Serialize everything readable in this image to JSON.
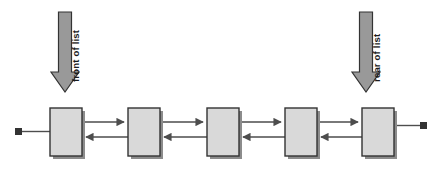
{
  "diagram": {
    "type": "doubly-linked-list",
    "background_color": "#ffffff",
    "node_count": 5,
    "node_fill": "#d9d9d9",
    "node_stroke": "#333333",
    "node_shadow": "#8c8c8c",
    "line_color": "#4d4d4d",
    "terminator_color": "#333333",
    "arrow_fill": "#999999",
    "arrow_stroke": "#333333",
    "nodes": [
      {
        "id": "node-1",
        "label": "",
        "x": 50,
        "y": 108,
        "width": 32,
        "height": 48
      },
      {
        "id": "node-2",
        "label": "",
        "x": 128,
        "y": 108,
        "width": 32,
        "height": 48
      },
      {
        "id": "node-3",
        "label": "",
        "x": 207,
        "y": 108,
        "width": 32,
        "height": 48
      },
      {
        "id": "node-4",
        "label": "",
        "x": 285,
        "y": 108,
        "width": 32,
        "height": 48
      },
      {
        "id": "node-5",
        "label": "",
        "x": 362,
        "y": 108,
        "width": 32,
        "height": 48
      }
    ],
    "links": [
      {
        "id": "link-1-2",
        "from": "node-1",
        "to": "node-2",
        "direction": "bidirectional"
      },
      {
        "id": "link-2-3",
        "from": "node-2",
        "to": "node-3",
        "direction": "bidirectional"
      },
      {
        "id": "link-3-4",
        "from": "node-3",
        "to": "node-4",
        "direction": "bidirectional"
      },
      {
        "id": "link-4-5",
        "from": "node-4",
        "to": "node-5",
        "direction": "bidirectional"
      }
    ],
    "terminators": [
      {
        "id": "terminator-left",
        "side": "left",
        "x": 18,
        "y": 131,
        "size": 7
      },
      {
        "id": "terminator-right",
        "side": "right",
        "x": 420,
        "y": 122,
        "size": 7
      }
    ],
    "pointers": [
      {
        "id": "front-pointer",
        "label": "front of list",
        "target_node": "node-1",
        "orientation": "vertical-down",
        "text_rotation": "-90deg",
        "shaft_x": 65,
        "shaft_top": 12,
        "shaft_bottom": 72,
        "tip_y": 92
      },
      {
        "id": "rear-pointer",
        "label": "rear of list",
        "target_node": "node-5",
        "orientation": "vertical-down",
        "text_rotation": "-90deg",
        "shaft_x": 366,
        "shaft_top": 12,
        "shaft_bottom": 72,
        "tip_y": 92
      }
    ]
  }
}
